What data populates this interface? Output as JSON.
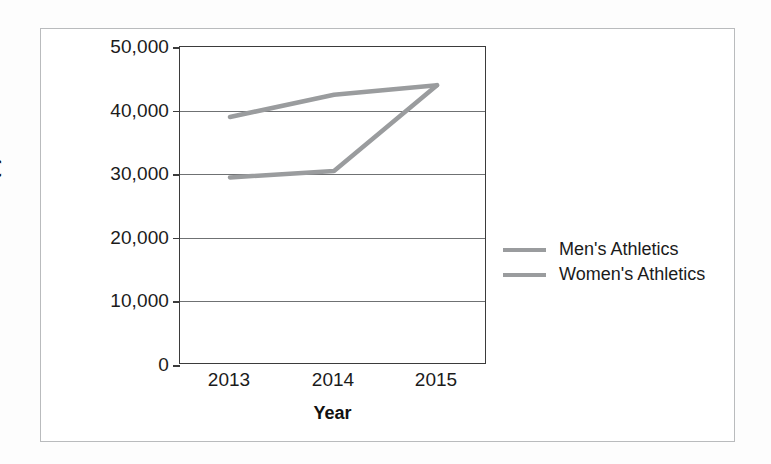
{
  "chart_data": {
    "type": "line",
    "title": "",
    "xlabel": "Year",
    "ylabel": "Amount ($)",
    "categories": [
      "2013",
      "2014",
      "2015"
    ],
    "ylim": [
      0,
      50000
    ],
    "yticks": [
      "0",
      "10,000",
      "20,000",
      "30,000",
      "40,000",
      "50,000"
    ],
    "ytick_values": [
      0,
      10000,
      20000,
      30000,
      40000,
      50000
    ],
    "grid": "horizontal",
    "legend_position": "right",
    "series": [
      {
        "name": "Men's Athletics",
        "values": [
          39000,
          42500,
          44000
        ],
        "color": "#9a9c9e"
      },
      {
        "name": "Women's Athletics",
        "values": [
          29500,
          30500,
          44000
        ],
        "color": "#9a9c9e"
      }
    ]
  },
  "colors": {
    "series_line": "#9a9c9e",
    "axis": "#3b3b3b",
    "gridline": "#6f7173",
    "text": "#1b1b1b",
    "frame": "#b9bbbd",
    "background": "#ffffff"
  }
}
